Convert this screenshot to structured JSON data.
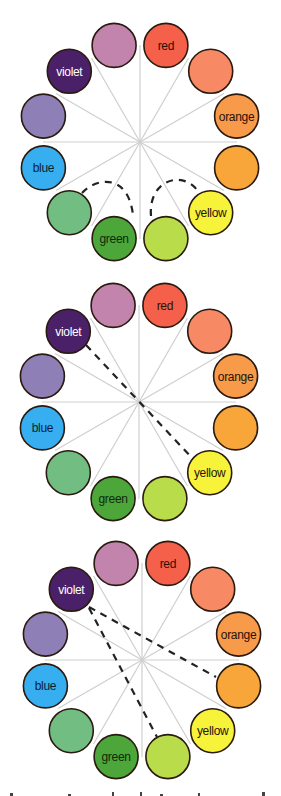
{
  "figure": {
    "wheel_radius": 100,
    "swatch_radius": 22,
    "spoke_color": "#cfcfcf",
    "outline_color": "#2a1a10",
    "hues": [
      {
        "id": "red",
        "label": "red",
        "color": "#f5604a",
        "text_color": "#2a1208"
      },
      {
        "id": "red-orange",
        "label": "",
        "color": "#f78a64",
        "text_color": "#2a1208"
      },
      {
        "id": "orange",
        "label": "orange",
        "color": "#f79a4a",
        "text_color": "#2a1208"
      },
      {
        "id": "yellow-orange",
        "label": "",
        "color": "#f8a53a",
        "text_color": "#2a1208"
      },
      {
        "id": "yellow",
        "label": "yellow",
        "color": "#f7f23a",
        "text_color": "#2a1208"
      },
      {
        "id": "yellow-green",
        "label": "",
        "color": "#b9dc4a",
        "text_color": "#2a1208"
      },
      {
        "id": "green",
        "label": "green",
        "color": "#4ca63a",
        "text_color": "#0f2a0a"
      },
      {
        "id": "blue-green",
        "label": "",
        "color": "#72be82",
        "text_color": "#0f2a0a"
      },
      {
        "id": "blue",
        "label": "blue",
        "color": "#36aef0",
        "text_color": "#0a1f33"
      },
      {
        "id": "blue-violet",
        "label": "",
        "color": "#8e80b6",
        "text_color": "#ffffff"
      },
      {
        "id": "violet",
        "label": "violet",
        "color": "#4a2168",
        "text_color": "#ffffff"
      },
      {
        "id": "red-violet",
        "label": "",
        "color": "#c283ad",
        "text_color": "#2a1208"
      }
    ],
    "wheels": [
      {
        "name": "analogous-wheel",
        "center": [
          140,
          142
        ],
        "connectors": [
          {
            "type": "arc",
            "path": "M 82 193 C 95 178, 128 172, 133 215"
          },
          {
            "type": "arc",
            "path": "M 151 216 C 148 180, 182 170, 197 190"
          }
        ]
      },
      {
        "name": "complementary-wheel",
        "center": [
          139,
          402
        ],
        "connectors": [
          {
            "type": "line",
            "from": [
              86,
              345
            ],
            "to": [
              193,
              459
            ]
          }
        ]
      },
      {
        "name": "split-complementary-wheel",
        "center": [
          142,
          660
        ],
        "connectors": [
          {
            "type": "line",
            "from": [
              89,
              607
            ],
            "to": [
              216,
              677
            ]
          },
          {
            "type": "line",
            "from": [
              89,
              608
            ],
            "to": [
              157,
              737
            ]
          }
        ]
      }
    ]
  }
}
